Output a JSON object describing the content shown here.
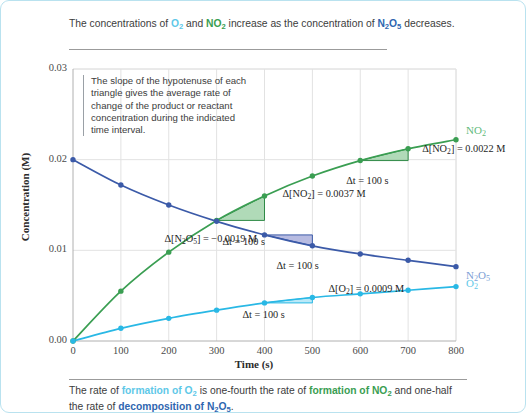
{
  "figure": {
    "border_color": "#b9e2ef",
    "caption_top": {
      "segments": [
        {
          "t": "The concentrations of ",
          "style": "plain"
        },
        {
          "t": "O2",
          "style": "o2"
        },
        {
          "t": " and ",
          "style": "plain"
        },
        {
          "t": "NO2",
          "style": "no2"
        },
        {
          "t": " increase as the concentration of ",
          "style": "plain"
        },
        {
          "t": "N2O5",
          "style": "n2o5"
        },
        {
          "t": " decreases.",
          "style": "plain"
        }
      ],
      "plain_text": "The concentrations of O2 and NO2 increase as the concentration of N2O5 decreases."
    },
    "caption_bottom": {
      "segments": [
        {
          "t": "The rate of ",
          "style": "plain"
        },
        {
          "t": "formation of O2",
          "style": "o2"
        },
        {
          "t": " is one-fourth the rate of ",
          "style": "plain"
        },
        {
          "t": "formation of NO2",
          "style": "no2"
        },
        {
          "t": " and one-half the rate of ",
          "style": "plain"
        },
        {
          "t": "decomposition of N2O5",
          "style": "n2o5"
        },
        {
          "t": ".",
          "style": "plain"
        }
      ],
      "plain_text": "The rate of formation of O2 is one-fourth the rate of formation of NO2 and one-half the rate of decomposition of N2O5."
    }
  },
  "note": {
    "text": "The slope of the hypotenuse of each triangle gives the average rate of change of the product or reactant concentration during the indicated time interval."
  },
  "chart_data": {
    "type": "line",
    "title": "",
    "xlabel": "Time (s)",
    "ylabel": "Concentration (M)",
    "xlim": [
      0,
      800
    ],
    "ylim": [
      0,
      0.03
    ],
    "xticks": [
      0,
      100,
      200,
      300,
      400,
      500,
      600,
      700,
      800
    ],
    "xticklabels": [
      "0",
      "100",
      "200",
      "300",
      "400",
      "500",
      "600",
      "700",
      "800"
    ],
    "yticks": [
      0,
      0.01,
      0.02,
      0.03
    ],
    "yticklabels": [
      "0.00",
      "0.01",
      "0.02",
      "0.03"
    ],
    "grid": true,
    "legend_position": "right-of-curve-ends",
    "x": [
      0,
      100,
      200,
      300,
      400,
      500,
      600,
      700,
      800
    ],
    "series": [
      {
        "name": "NO2",
        "label": "NO2",
        "color": "#3a9e52",
        "values": [
          0.0,
          0.0055,
          0.0098,
          0.0133,
          0.016,
          0.0182,
          0.0199,
          0.0212,
          0.0222
        ]
      },
      {
        "name": "N2O5",
        "label": "N2O5",
        "color": "#3b5aa8",
        "values": [
          0.02,
          0.0172,
          0.015,
          0.0132,
          0.0117,
          0.0105,
          0.0096,
          0.0089,
          0.0082
        ]
      },
      {
        "name": "O2",
        "label": "O2",
        "color": "#29b8e5",
        "values": [
          0.0,
          0.0014,
          0.0025,
          0.0034,
          0.0042,
          0.0048,
          0.0052,
          0.0056,
          0.006
        ]
      }
    ],
    "annotations": [
      {
        "id": "no2-triangle-1",
        "series": "NO2",
        "x_start": 300,
        "x_end": 400,
        "delta_label": "Δ[NO2] = 0.0037 M",
        "dt_label": "Δt = 100 s",
        "fill": "#7fc48d",
        "edge": "#2f8a47"
      },
      {
        "id": "no2-triangle-2",
        "series": "NO2",
        "x_start": 600,
        "x_end": 700,
        "delta_label": "Δ[NO2] = 0.0022 M",
        "dt_label": "Δt = 100 s",
        "fill": "#7fc48d",
        "edge": "#2f8a47"
      },
      {
        "id": "n2o5-triangle",
        "series": "N2O5",
        "x_start": 400,
        "x_end": 500,
        "delta_label": "Δ[N2O5] = −0.0019 M",
        "dt_label": "Δt = 100 s",
        "fill": "#8a92cf",
        "edge": "#3b5aa8"
      },
      {
        "id": "o2-triangle",
        "series": "O2",
        "x_start": 400,
        "x_end": 500,
        "delta_label": "Δ[O2] = 0.0009 M",
        "dt_label": "Δt = 100 s",
        "fill": "#8fdcf3",
        "edge": "#29b8e5"
      }
    ]
  }
}
